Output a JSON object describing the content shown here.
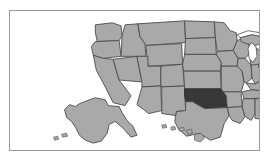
{
  "image": {
    "kind": "choropleth-locator-map",
    "subject": "United States of America",
    "width": 271,
    "height": 165,
    "background_color": "#ffffff"
  },
  "frame": {
    "border_color": "#9a9a9a",
    "border_width_px": 1,
    "fill_color": "#ffffff"
  },
  "legend_colors": {
    "state_fill": "#a9a9a9",
    "state_border": "#4a4a4a",
    "highlight_fill": "#383838",
    "highlight_border": "#2a2a2a",
    "water_fill": "#ffffff"
  },
  "map": {
    "title": "",
    "projection_note": "Alaska and Hawaii shown as insets at lower left",
    "highlighted_region": {
      "name": "Oklahoma",
      "abbreviation": "OK",
      "fill": "#383838"
    },
    "insets": [
      {
        "name": "Alaska",
        "abbreviation": "AK"
      },
      {
        "name": "Hawaii",
        "abbreviation": "HI"
      }
    ],
    "water_bodies": [
      {
        "name": "Lake Michigan"
      },
      {
        "name": "Lake Superior"
      },
      {
        "name": "Lake Huron"
      },
      {
        "name": "Lake Erie"
      },
      {
        "name": "Lake Ontario"
      }
    ],
    "states": [
      {
        "name": "Washington",
        "abbreviation": "WA",
        "highlighted": false
      },
      {
        "name": "Oregon",
        "abbreviation": "OR",
        "highlighted": false
      },
      {
        "name": "California",
        "abbreviation": "CA",
        "highlighted": false
      },
      {
        "name": "Nevada",
        "abbreviation": "NV",
        "highlighted": false
      },
      {
        "name": "Idaho",
        "abbreviation": "ID",
        "highlighted": false
      },
      {
        "name": "Montana",
        "abbreviation": "MT",
        "highlighted": false
      },
      {
        "name": "Wyoming",
        "abbreviation": "WY",
        "highlighted": false
      },
      {
        "name": "Utah",
        "abbreviation": "UT",
        "highlighted": false
      },
      {
        "name": "Arizona",
        "abbreviation": "AZ",
        "highlighted": false
      },
      {
        "name": "New Mexico",
        "abbreviation": "NM",
        "highlighted": false
      },
      {
        "name": "Colorado",
        "abbreviation": "CO",
        "highlighted": false
      },
      {
        "name": "North Dakota",
        "abbreviation": "ND",
        "highlighted": false
      },
      {
        "name": "South Dakota",
        "abbreviation": "SD",
        "highlighted": false
      },
      {
        "name": "Nebraska",
        "abbreviation": "NE",
        "highlighted": false
      },
      {
        "name": "Kansas",
        "abbreviation": "KS",
        "highlighted": false
      },
      {
        "name": "Oklahoma",
        "abbreviation": "OK",
        "highlighted": true
      },
      {
        "name": "Texas",
        "abbreviation": "TX",
        "highlighted": false
      },
      {
        "name": "Minnesota",
        "abbreviation": "MN",
        "highlighted": false
      },
      {
        "name": "Iowa",
        "abbreviation": "IA",
        "highlighted": false
      },
      {
        "name": "Missouri",
        "abbreviation": "MO",
        "highlighted": false
      },
      {
        "name": "Arkansas",
        "abbreviation": "AR",
        "highlighted": false
      },
      {
        "name": "Louisiana",
        "abbreviation": "LA",
        "highlighted": false
      },
      {
        "name": "Wisconsin",
        "abbreviation": "WI",
        "highlighted": false
      },
      {
        "name": "Illinois",
        "abbreviation": "IL",
        "highlighted": false
      },
      {
        "name": "Michigan",
        "abbreviation": "MI",
        "highlighted": false
      },
      {
        "name": "Indiana",
        "abbreviation": "IN",
        "highlighted": false
      },
      {
        "name": "Ohio",
        "abbreviation": "OH",
        "highlighted": false
      },
      {
        "name": "Kentucky",
        "abbreviation": "KY",
        "highlighted": false
      },
      {
        "name": "Tennessee",
        "abbreviation": "TN",
        "highlighted": false
      },
      {
        "name": "Mississippi",
        "abbreviation": "MS",
        "highlighted": false
      },
      {
        "name": "Alabama",
        "abbreviation": "AL",
        "highlighted": false
      },
      {
        "name": "Georgia",
        "abbreviation": "GA",
        "highlighted": false
      },
      {
        "name": "Florida",
        "abbreviation": "FL",
        "highlighted": false
      },
      {
        "name": "South Carolina",
        "abbreviation": "SC",
        "highlighted": false
      },
      {
        "name": "North Carolina",
        "abbreviation": "NC",
        "highlighted": false
      },
      {
        "name": "Virginia",
        "abbreviation": "VA",
        "highlighted": false
      },
      {
        "name": "West Virginia",
        "abbreviation": "WV",
        "highlighted": false
      },
      {
        "name": "Maryland",
        "abbreviation": "MD",
        "highlighted": false
      },
      {
        "name": "Delaware",
        "abbreviation": "DE",
        "highlighted": false
      },
      {
        "name": "Pennsylvania",
        "abbreviation": "PA",
        "highlighted": false
      },
      {
        "name": "New Jersey",
        "abbreviation": "NJ",
        "highlighted": false
      },
      {
        "name": "New York",
        "abbreviation": "NY",
        "highlighted": false
      },
      {
        "name": "Connecticut",
        "abbreviation": "CT",
        "highlighted": false
      },
      {
        "name": "Rhode Island",
        "abbreviation": "RI",
        "highlighted": false
      },
      {
        "name": "Massachusetts",
        "abbreviation": "MA",
        "highlighted": false
      },
      {
        "name": "Vermont",
        "abbreviation": "VT",
        "highlighted": false
      },
      {
        "name": "New Hampshire",
        "abbreviation": "NH",
        "highlighted": false
      },
      {
        "name": "Maine",
        "abbreviation": "ME",
        "highlighted": false
      },
      {
        "name": "Alaska",
        "abbreviation": "AK",
        "highlighted": false
      },
      {
        "name": "Hawaii",
        "abbreviation": "HI",
        "highlighted": false
      }
    ]
  }
}
